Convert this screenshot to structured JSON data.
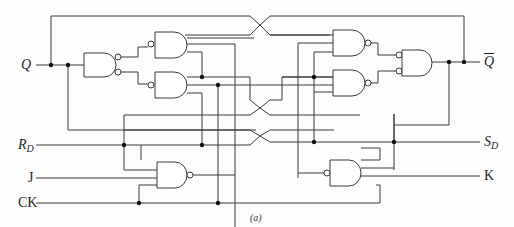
{
  "diagram": {
    "type": "logic-circuit",
    "caption": "(a)",
    "labels": {
      "q": "Q",
      "q_bar": "Q",
      "rd_main": "R",
      "rd_sub": "D",
      "j": "J",
      "ck": "CK",
      "sd_main": "S",
      "sd_sub": "D",
      "k": "K"
    },
    "gates": [
      {
        "id": "G1",
        "kind": "AND with inverted outputs",
        "position": "left input gate"
      },
      {
        "id": "G2",
        "kind": "NAND",
        "position": "left upper master"
      },
      {
        "id": "G3",
        "kind": "NAND",
        "position": "left lower master"
      },
      {
        "id": "G4",
        "kind": "NAND",
        "position": "right upper slave"
      },
      {
        "id": "G5",
        "kind": "NAND",
        "position": "right lower slave"
      },
      {
        "id": "G6",
        "kind": "AND with inverted inputs",
        "position": "right output gate"
      },
      {
        "id": "G7",
        "kind": "NAND",
        "position": "bottom left (J input)"
      },
      {
        "id": "G8",
        "kind": "AND with inverted input",
        "position": "bottom right (K input)"
      }
    ],
    "inputs": [
      "RD",
      "J",
      "CK",
      "SD",
      "K"
    ],
    "outputs": [
      "Q",
      "Q-bar"
    ]
  }
}
